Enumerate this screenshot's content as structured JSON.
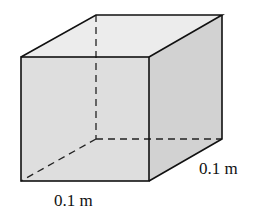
{
  "figure": {
    "type": "cube",
    "labels": {
      "front_width": "0.1 m",
      "depth": "0.1 m"
    },
    "colors": {
      "edge": "#111111",
      "front_face": "#dcdcdc",
      "top_face": "#ebebeb",
      "side_face": "#cfcfcf"
    }
  }
}
